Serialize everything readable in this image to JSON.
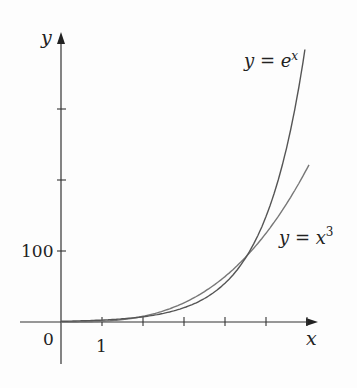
{
  "chart_data": {
    "type": "line",
    "title": "",
    "xlabel": "x",
    "ylabel": "y",
    "x_ticks": [
      1,
      2,
      3,
      4,
      5,
      6
    ],
    "x_tick_labels": [
      "0",
      "1"
    ],
    "y_ticks": [
      100,
      200,
      300
    ],
    "y_tick_labels": [
      "100"
    ],
    "xlim": [
      -1,
      6.3
    ],
    "ylim": [
      -60,
      410
    ],
    "series": [
      {
        "name": "y = e^x",
        "function": "exp(x)",
        "x": [
          0,
          1,
          2,
          3,
          4,
          5,
          6
        ],
        "values": [
          1,
          2.72,
          7.39,
          20.09,
          54.6,
          148.4,
          403.4
        ]
      },
      {
        "name": "y = x^3",
        "function": "x^3",
        "x": [
          0,
          1,
          2,
          3,
          4,
          5,
          6
        ],
        "values": [
          0,
          1,
          8,
          27,
          64,
          125,
          216
        ]
      }
    ],
    "annotations": [
      "y = e^x",
      "y = x^3"
    ],
    "grid": false,
    "legend": "inline labels"
  },
  "labels": {
    "y_axis": "y",
    "x_axis": "x",
    "origin": "0",
    "x_one": "1",
    "y_hundred": "100",
    "exp_base": "y = e",
    "exp_sup": "x",
    "cube_base": "y = x",
    "cube_sup": "3"
  }
}
